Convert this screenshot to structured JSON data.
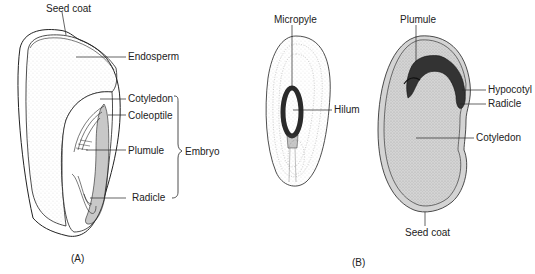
{
  "figure_a": {
    "caption": "(A)",
    "labels": {
      "seed_coat": "Seed coat",
      "endosperm": "Endosperm",
      "cotyledon": "Cotyledon",
      "coleoptile": "Coleoptile",
      "plumule": "Plumule",
      "radicle": "Radicle",
      "embryo": "Embryo"
    }
  },
  "figure_b": {
    "caption": "(B)",
    "external_view": {
      "labels": {
        "micropyle": "Micropyle",
        "hilum": "Hilum"
      }
    },
    "internal_view": {
      "labels": {
        "plumule": "Plumule",
        "hypocotyl": "Hypocotyl",
        "radicle": "Radicle",
        "cotyledon": "Cotyledon",
        "seed_coat": "Seed coat"
      }
    }
  },
  "colors": {
    "ink": "#222222",
    "stipple": "#9a9a9a",
    "embryo_dark": "#3a3a3a"
  }
}
